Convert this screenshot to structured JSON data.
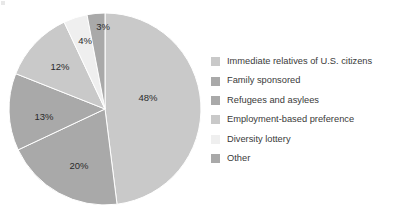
{
  "chart_data": {
    "type": "pie",
    "title": "",
    "subtitle": "",
    "xlabel": "",
    "ylabel": "",
    "grid": false,
    "legend_position": "right",
    "start_angle_deg": 0,
    "direction": "clockwise",
    "center": {
      "x": 105,
      "y": 109
    },
    "radius": 96,
    "unit": "%",
    "categories": [
      "Immediate relatives of U.S. citizens",
      "Family sponsored",
      "Refugees and asylees",
      "Employment-based preference",
      "Diversity lottery",
      "Other"
    ],
    "values": [
      48,
      20,
      13,
      12,
      4,
      3
    ],
    "data_labels": [
      "48%",
      "20%",
      "13%",
      "12%",
      "4%",
      "3%"
    ],
    "colors": [
      "#c9c9c9",
      "#a9a9a9",
      "#a9a9a9",
      "#c9c9c9",
      "#efefef",
      "#a9a9a9"
    ],
    "slices": [
      {
        "label": "Immediate relatives of U.S. citizens",
        "value": 48,
        "data_label": "48%",
        "color": "#c9c9c9",
        "label_x": 148,
        "label_y": 98
      },
      {
        "label": "Family sponsored",
        "value": 20,
        "data_label": "20%",
        "color": "#a9a9a9",
        "label_x": 79,
        "label_y": 166
      },
      {
        "label": "Refugees and asylees",
        "value": 13,
        "data_label": "13%",
        "color": "#a9a9a9",
        "label_x": 44,
        "label_y": 117
      },
      {
        "label": "Employment-based preference",
        "value": 12,
        "data_label": "12%",
        "color": "#c9c9c9",
        "label_x": 60,
        "label_y": 67
      },
      {
        "label": "Diversity lottery",
        "value": 4,
        "data_label": "4%",
        "color": "#efefef",
        "label_x": 85,
        "label_y": 41
      },
      {
        "label": "Other",
        "value": 3,
        "data_label": "3%",
        "color": "#a9a9a9",
        "label_x": 103,
        "label_y": 27
      }
    ]
  },
  "legend": {
    "items": [
      {
        "label": "Immediate relatives of U.S. citizens",
        "color": "#c9c9c9"
      },
      {
        "label": "Family sponsored",
        "color": "#a9a9a9"
      },
      {
        "label": "Refugees and asylees",
        "color": "#a9a9a9"
      },
      {
        "label": "Employment-based preference",
        "color": "#c9c9c9"
      },
      {
        "label": "Diversity lottery",
        "color": "#efefef"
      },
      {
        "label": "Other",
        "color": "#a9a9a9"
      }
    ]
  }
}
